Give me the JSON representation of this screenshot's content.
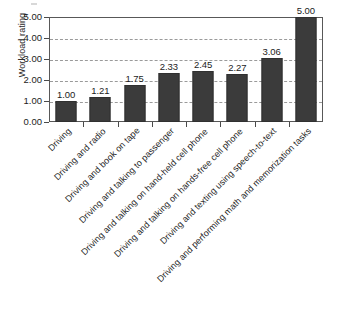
{
  "chart_data": {
    "type": "bar",
    "title": "",
    "xlabel": "",
    "ylabel": "Workload rating",
    "ylim": [
      0,
      5
    ],
    "ytick_labels": [
      "5.00",
      "4.00",
      "3.00",
      "2.00",
      "1.00",
      "0.00"
    ],
    "ytick_values": [
      5,
      4,
      3,
      2,
      1,
      0
    ],
    "grid": true,
    "grid_style": "dashed-horizontal",
    "legend": "none",
    "bar_color": "#3b3b3b",
    "categories": [
      "Driving",
      "Driving and radio",
      "Driving and book on tape",
      "Driving and talking to passenger",
      "Driving and talking on hand-held cell phone",
      "Driving and talking on hands-free cell phone",
      "Driving and texting using speech-to-text",
      "Driving and performing math and memorization tasks"
    ],
    "values": [
      1.0,
      1.21,
      1.75,
      2.33,
      2.45,
      2.27,
      3.06,
      5.0
    ],
    "value_labels": [
      "1.00",
      "1.21",
      "1.75",
      "2.33",
      "2.45",
      "2.27",
      "3.06",
      "5.00"
    ]
  }
}
